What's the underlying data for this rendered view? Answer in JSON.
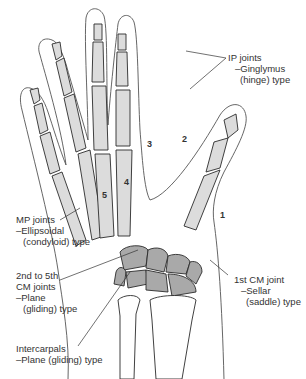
{
  "figure": {
    "colors": {
      "bone_fill": "#dcdcdc",
      "carpal_fill": "#a9a9a9",
      "outline": "#2b2b2b",
      "skin_outline": "#555555",
      "background": "#ffffff"
    },
    "metacarpal_numbers": [
      "1",
      "2",
      "3",
      "4",
      "5"
    ],
    "signature": "Beaudet '92"
  },
  "labels": {
    "ip_joints": {
      "title": "IP joints",
      "line2": "–Ginglymus",
      "line3": "(hinge) type"
    },
    "mp_joints": {
      "title": "MP joints",
      "line2": "–Ellipsoidal",
      "line3": "(condyloid) type"
    },
    "cm_2_5": {
      "line1": "2nd to 5th",
      "line2": "CM joints",
      "line3": "–Plane",
      "line4": "(gliding) type"
    },
    "intercarpals": {
      "title": "Intercarpals",
      "line2": "–Plane (gliding) type"
    },
    "cm_1": {
      "title": "1st CM joint",
      "line2": "–Sellar",
      "line3": "(saddle) type"
    }
  }
}
